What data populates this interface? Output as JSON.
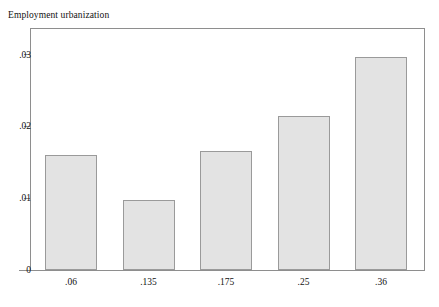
{
  "chart_data": {
    "type": "bar",
    "title": "Employment urbanization",
    "xlabel": "",
    "ylabel": "",
    "categories": [
      ".06",
      ".135",
      ".175",
      ".25",
      ".36"
    ],
    "values": [
      0.016,
      0.0098,
      0.0166,
      0.0215,
      0.0296
    ],
    "ytick_labels": [
      "0",
      ".01",
      ".02",
      ".03"
    ],
    "ytick_values": [
      0,
      0.01,
      0.02,
      0.03
    ],
    "ylim": [
      0,
      0.0337
    ],
    "xlim_categories": 5,
    "grid": false,
    "legend": null,
    "bar_fill_color": "#e3e3e3",
    "bar_border_color": "#9a9a9a",
    "axis_color": "#8e8e8e",
    "background_color": "#ffffff",
    "text_color": "#121212"
  }
}
